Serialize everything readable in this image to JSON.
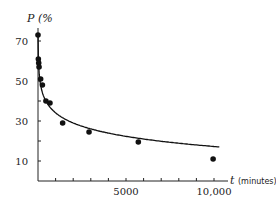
{
  "chart_data": {
    "type": "scatter",
    "title": "",
    "ylabel": "P (%",
    "xlabel": "t",
    "xlabel_unit": "(minutes)",
    "xlim": [
      0,
      10500
    ],
    "ylim": [
      0,
      76
    ],
    "x_ticks": [
      1000,
      2000,
      3000,
      4000,
      5000,
      6000,
      7000,
      8000,
      9000,
      10000
    ],
    "x_tick_labels": [
      {
        "value": 5000,
        "label": "5000"
      },
      {
        "value": 10000,
        "label": "10,000"
      }
    ],
    "y_ticks": [
      10,
      20,
      30,
      40,
      50,
      60,
      70
    ],
    "y_tick_labels": [
      {
        "value": 10,
        "label": "10"
      },
      {
        "value": 30,
        "label": "30"
      },
      {
        "value": 50,
        "label": "50"
      },
      {
        "value": 70,
        "label": "70"
      }
    ],
    "grid": false,
    "series": [
      {
        "name": "observed",
        "kind": "points",
        "points": [
          [
            0,
            73
          ],
          [
            20,
            61
          ],
          [
            40,
            59
          ],
          [
            60,
            57
          ],
          [
            150,
            51
          ],
          [
            250,
            48
          ],
          [
            450,
            40
          ],
          [
            680,
            39
          ],
          [
            1400,
            29
          ],
          [
            2900,
            24.5
          ],
          [
            5700,
            19.5
          ],
          [
            9950,
            11
          ]
        ]
      },
      {
        "name": "fitted curve",
        "kind": "line",
        "model": "P = 84.5 - 7.3*ln(t) approx (log curve)"
      }
    ]
  }
}
